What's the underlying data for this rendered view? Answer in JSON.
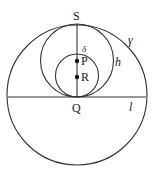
{
  "figure": {
    "type": "geometry-diagram",
    "stroke_color": "#333333",
    "background": "#ffffff",
    "circles": [
      {
        "name": "gamma",
        "label": "γ",
        "cx": 77,
        "cy": 95,
        "r": 70
      },
      {
        "name": "h",
        "label": "h",
        "cx": 77,
        "cy": 60.5,
        "r": 36.5
      },
      {
        "name": "delta",
        "label": "δ",
        "cx": 77,
        "cy": 75.5,
        "r": 21.5
      }
    ],
    "lines": [
      {
        "name": "l",
        "label": "l",
        "x1": 8,
        "y1": 97,
        "x2": 146,
        "y2": 97
      },
      {
        "name": "SQ",
        "label": "",
        "x1": 77,
        "y1": 24,
        "x2": 77,
        "y2": 97
      }
    ],
    "points": [
      {
        "name": "P",
        "label": "P",
        "x": 77,
        "y": 61,
        "dot": true
      },
      {
        "name": "R",
        "label": "R",
        "x": 77,
        "y": 77,
        "dot": true
      },
      {
        "name": "S",
        "label": "S",
        "x": 77,
        "y": 24,
        "dot": false
      },
      {
        "name": "Q",
        "label": "Q",
        "x": 77,
        "y": 97,
        "dot": false
      }
    ],
    "labels": {
      "S": "S",
      "Q": "Q",
      "P": "P",
      "R": "R",
      "gamma": "γ",
      "h": "h",
      "delta": "δ",
      "l": "l"
    }
  }
}
